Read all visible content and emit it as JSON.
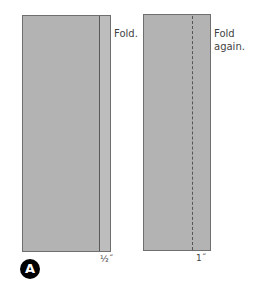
{
  "diagram": {
    "panel_left": {
      "label": "Fold.",
      "measurement": "½˝"
    },
    "panel_right": {
      "label_line1": "Fold",
      "label_line2": "again.",
      "measurement": "1˝"
    },
    "step_badge": "A",
    "colors": {
      "fabric": "#b3b3b3",
      "outline": "#6f6f6f",
      "badge": "#000000"
    }
  }
}
